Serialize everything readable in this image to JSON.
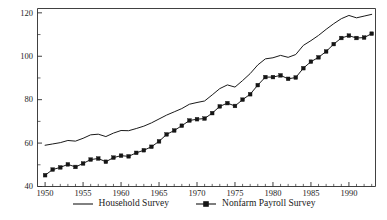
{
  "chart_data": {
    "type": "line",
    "title": "",
    "subtitle": "",
    "xlabel": "",
    "ylabel": "",
    "xlim": [
      1949.0,
      1993.5
    ],
    "ylim": [
      40,
      122
    ],
    "grid": false,
    "legend_position": "bottom-center",
    "x_ticks_major": [
      1950,
      1955,
      1960,
      1965,
      1970,
      1975,
      1980,
      1985,
      1990
    ],
    "x_tick_labels": [
      "1950",
      "1955",
      "1960",
      "1965",
      "1970",
      "1975",
      "1980",
      "1985",
      "1990"
    ],
    "x_tick_minor_step": 1,
    "y_ticks_major": [
      40,
      60,
      80,
      100,
      120
    ],
    "y_tick_labels": [
      "40",
      "60",
      "80",
      "100",
      "120"
    ],
    "y_ticks_minor": [
      50,
      70,
      90,
      110
    ],
    "x": [
      1950,
      1951,
      1952,
      1953,
      1954,
      1955,
      1956,
      1957,
      1958,
      1959,
      1960,
      1961,
      1962,
      1963,
      1964,
      1965,
      1966,
      1967,
      1968,
      1969,
      1970,
      1971,
      1972,
      1973,
      1974,
      1975,
      1976,
      1977,
      1978,
      1979,
      1980,
      1981,
      1982,
      1983,
      1984,
      1985,
      1986,
      1987,
      1988,
      1989,
      1990,
      1991,
      1992,
      1993
    ],
    "series": [
      {
        "name": "Household Survey",
        "marker": "none",
        "color": "#1a1a1a",
        "values": [
          59.0,
          59.6,
          60.2,
          61.2,
          60.9,
          62.2,
          63.8,
          64.1,
          63.0,
          64.6,
          65.8,
          65.7,
          66.7,
          67.8,
          69.3,
          71.1,
          72.9,
          74.4,
          75.9,
          77.9,
          78.7,
          79.4,
          82.2,
          85.1,
          86.8,
          85.8,
          88.8,
          92.0,
          96.0,
          98.8,
          99.3,
          100.4,
          99.5,
          100.8,
          105.0,
          107.2,
          109.6,
          112.4,
          115.0,
          117.3,
          118.8,
          117.7,
          118.5,
          119.3
        ]
      },
      {
        "name": "Nonfarm Payroll Survey",
        "marker": "square",
        "color": "#151515",
        "values": [
          45.2,
          47.8,
          48.8,
          50.2,
          49.0,
          50.6,
          52.4,
          52.9,
          51.4,
          53.3,
          54.2,
          53.9,
          55.5,
          56.7,
          58.3,
          60.8,
          64.0,
          65.8,
          68.0,
          70.4,
          71.0,
          71.3,
          73.8,
          76.9,
          78.4,
          77.1,
          80.0,
          82.5,
          86.7,
          90.4,
          90.4,
          91.2,
          89.6,
          90.2,
          94.5,
          97.5,
          99.5,
          102.2,
          105.6,
          108.4,
          109.5,
          108.4,
          108.6,
          110.4
        ]
      }
    ]
  },
  "legend": {
    "entries": [
      {
        "label": "Household Survey",
        "style": "line"
      },
      {
        "label": "Nonfarm Payroll Survey",
        "style": "line-with-marker"
      }
    ]
  },
  "colors": {
    "axis": "#2b2b2b",
    "household": "#1a1a1a",
    "nonfarm": "#151515",
    "background": "#ffffff"
  }
}
